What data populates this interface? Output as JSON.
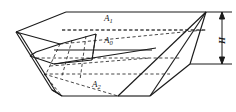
{
  "figure": {
    "type": "engineering-line-diagram",
    "labels": {
      "top_area": "A",
      "top_area_sub": "1",
      "mid_area": "A",
      "mid_area_sub": "0",
      "bottom_area": "A",
      "bottom_area_sub": "2",
      "height": "H"
    },
    "colors": {
      "stroke": "#1a1a1a",
      "hidden_stroke": "#333333",
      "background": "#ffffff"
    },
    "line_styles": {
      "visible": "solid",
      "hidden": "dashed"
    },
    "dimension": {
      "name": "H",
      "orientation": "vertical",
      "arrow_ends": "both"
    }
  }
}
